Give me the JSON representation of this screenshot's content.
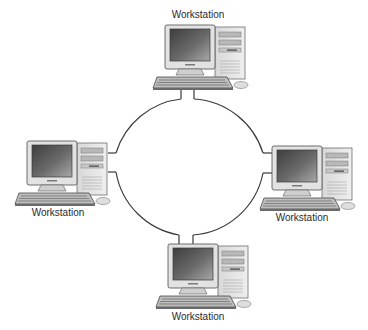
{
  "diagram": {
    "type": "ring-network-topology",
    "ring": {
      "stroke_color": "#3a3a3a"
    },
    "nodes": [
      {
        "id": "top",
        "label": "Workstation",
        "position": "top"
      },
      {
        "id": "left",
        "label": "Workstation",
        "position": "left"
      },
      {
        "id": "right",
        "label": "Workstation",
        "position": "right"
      },
      {
        "id": "bottom",
        "label": "Workstation",
        "position": "bottom"
      }
    ],
    "edges": [
      {
        "from": "top",
        "to": "right"
      },
      {
        "from": "right",
        "to": "bottom"
      },
      {
        "from": "bottom",
        "to": "left"
      },
      {
        "from": "left",
        "to": "top"
      }
    ],
    "colors": {
      "background": "#ffffff",
      "line": "#3a3a3a",
      "case_light": "#e6e6e6",
      "case_mid": "#c4c4c4",
      "case_dark": "#8a8a8a",
      "screen_dark": "#4a4a4a",
      "screen_light": "#9a9a9a",
      "label_text": "#2a2a2a"
    }
  }
}
